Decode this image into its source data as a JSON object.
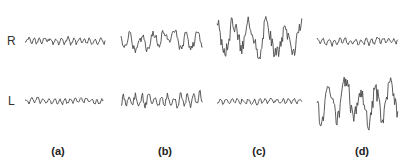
{
  "figure": {
    "rows": [
      {
        "id": "R",
        "label": "R"
      },
      {
        "id": "L",
        "label": "L"
      }
    ],
    "panels": [
      {
        "id": "a",
        "label": "(a)",
        "R_amplitude": "low",
        "L_amplitude": "low"
      },
      {
        "id": "b",
        "label": "(b)",
        "R_amplitude": "medium-high",
        "L_amplitude": "medium"
      },
      {
        "id": "c",
        "label": "(c)",
        "R_amplitude": "high",
        "L_amplitude": "low"
      },
      {
        "id": "d",
        "label": "(d)",
        "R_amplitude": "low",
        "L_amplitude": "high"
      }
    ],
    "trace_color": "#4a4a4a"
  },
  "traces": [
    {
      "panel": "a",
      "row": "R",
      "x0": 25,
      "x1": 105,
      "y": 41,
      "amp": 4,
      "seed": 1,
      "freq": 0.9
    },
    {
      "panel": "b",
      "row": "R",
      "x0": 121,
      "x1": 203,
      "y": 40,
      "amp": 12,
      "seed": 2,
      "freq": 0.45
    },
    {
      "panel": "c",
      "row": "R",
      "x0": 217,
      "x1": 302,
      "y": 38,
      "amp": 20,
      "seed": 3,
      "freq": 0.3
    },
    {
      "panel": "d",
      "row": "R",
      "x0": 317,
      "x1": 398,
      "y": 41,
      "amp": 4,
      "seed": 4,
      "freq": 0.9
    },
    {
      "panel": "a",
      "row": "L",
      "x0": 25,
      "x1": 104,
      "y": 101,
      "amp": 3.5,
      "seed": 5,
      "freq": 0.9
    },
    {
      "panel": "b",
      "row": "L",
      "x0": 121,
      "x1": 203,
      "y": 100,
      "amp": 8,
      "seed": 6,
      "freq": 0.8
    },
    {
      "panel": "c",
      "row": "L",
      "x0": 217,
      "x1": 302,
      "y": 101,
      "amp": 3.5,
      "seed": 7,
      "freq": 0.9
    },
    {
      "panel": "d",
      "row": "L",
      "x0": 317,
      "x1": 398,
      "y": 104,
      "amp": 24,
      "seed": 8,
      "freq": 0.32
    }
  ]
}
